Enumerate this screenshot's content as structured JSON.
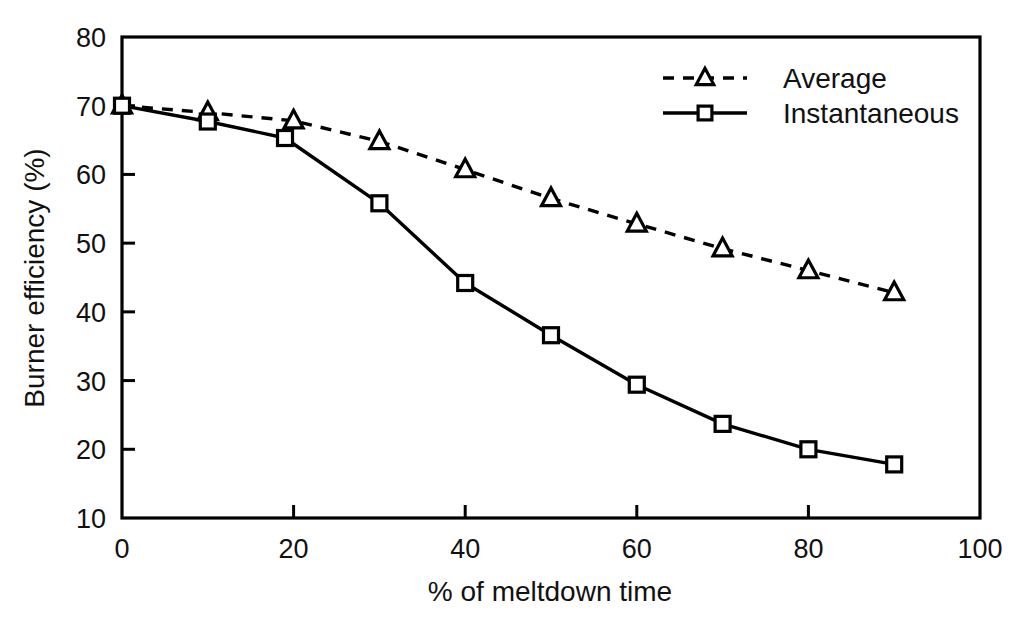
{
  "chart_data": {
    "type": "line",
    "title": "",
    "xlabel": "% of meltdown time",
    "ylabel": "Burner efficiency (%)",
    "xlim": [
      0,
      100
    ],
    "ylim": [
      10,
      80
    ],
    "xticks": [
      "0",
      "20",
      "40",
      "60",
      "80",
      "100"
    ],
    "xtick_values": [
      0,
      20,
      40,
      60,
      80,
      100
    ],
    "yticks": [
      "10",
      "20",
      "30",
      "40",
      "50",
      "60",
      "70",
      "80"
    ],
    "ytick_values": [
      10,
      20,
      30,
      40,
      50,
      60,
      70,
      80
    ],
    "grid": false,
    "legend_position": "top-right-inside",
    "x": [
      0,
      10,
      20,
      30,
      40,
      50,
      60,
      70,
      80,
      90
    ],
    "series": [
      {
        "name": "Average",
        "marker": "triangle",
        "linestyle": "dashed",
        "color": "#000000",
        "x": [
          0,
          10,
          20,
          30,
          40,
          50,
          60,
          70,
          80,
          90
        ],
        "values": [
          70.0,
          69.0,
          67.8,
          64.8,
          60.7,
          56.5,
          52.8,
          49.2,
          46.0,
          42.8
        ]
      },
      {
        "name": "Instantaneous",
        "marker": "square",
        "linestyle": "solid",
        "color": "#000000",
        "x": [
          0,
          10,
          19,
          30,
          40,
          50,
          60,
          70,
          80,
          90
        ],
        "values": [
          70.0,
          67.7,
          65.3,
          55.8,
          44.2,
          36.6,
          29.4,
          23.7,
          20.0,
          17.8
        ]
      }
    ]
  },
  "figure": {
    "background": "#ffffff",
    "axis_color": "#000000",
    "legend_entries": [
      {
        "label": "Average"
      },
      {
        "label": "Instantaneous"
      }
    ]
  }
}
